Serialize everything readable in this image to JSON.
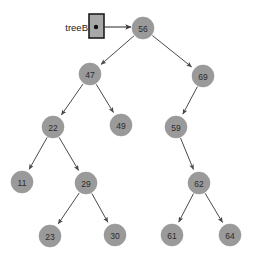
{
  "diagram": {
    "background_color": "#ffffff",
    "node_fill_color": "#9a9a9a",
    "node_text_color": "#2b2b2b",
    "edge_color": "#4a4a4a",
    "pointer_box": {
      "label": "treeB",
      "x": 89,
      "y": 14,
      "width": 15,
      "height": 24,
      "fill": "#a8a8a8",
      "border_color": "#1d1d1d",
      "dot_x": 96,
      "dot_y": 27,
      "dot_radius": 2.2,
      "label_x": 88,
      "label_y": 27
    },
    "pointer_arrow": {
      "x1": 104,
      "y1": 27,
      "x2": 131,
      "y2": 27
    },
    "node_radius": 11,
    "nodes": [
      {
        "id": "n56",
        "label": "56",
        "x": 143,
        "y": 28
      },
      {
        "id": "n47",
        "label": "47",
        "x": 90,
        "y": 74
      },
      {
        "id": "n69",
        "label": "69",
        "x": 203,
        "y": 76
      },
      {
        "id": "n22",
        "label": "22",
        "x": 53,
        "y": 127
      },
      {
        "id": "n49",
        "label": "49",
        "x": 121,
        "y": 125
      },
      {
        "id": "n59",
        "label": "59",
        "x": 176,
        "y": 127
      },
      {
        "id": "n11",
        "label": "11",
        "x": 22,
        "y": 182
      },
      {
        "id": "n29",
        "label": "29",
        "x": 86,
        "y": 183
      },
      {
        "id": "n62",
        "label": "62",
        "x": 199,
        "y": 183
      },
      {
        "id": "n23",
        "label": "23",
        "x": 50,
        "y": 236
      },
      {
        "id": "n30",
        "label": "30",
        "x": 115,
        "y": 235
      },
      {
        "id": "n61",
        "label": "61",
        "x": 172,
        "y": 235
      },
      {
        "id": "n64",
        "label": "64",
        "x": 230,
        "y": 235
      }
    ],
    "edges": [
      {
        "from": "n56",
        "to": "n47",
        "side": "left"
      },
      {
        "from": "n56",
        "to": "n69",
        "side": "right"
      },
      {
        "from": "n47",
        "to": "n22",
        "side": "left"
      },
      {
        "from": "n47",
        "to": "n49",
        "side": "right"
      },
      {
        "from": "n69",
        "to": "n59",
        "side": "left"
      },
      {
        "from": "n22",
        "to": "n11",
        "side": "left"
      },
      {
        "from": "n22",
        "to": "n29",
        "side": "right"
      },
      {
        "from": "n59",
        "to": "n62",
        "side": "right"
      },
      {
        "from": "n29",
        "to": "n23",
        "side": "left"
      },
      {
        "from": "n29",
        "to": "n30",
        "side": "right"
      },
      {
        "from": "n62",
        "to": "n61",
        "side": "left"
      },
      {
        "from": "n62",
        "to": "n64",
        "side": "right"
      }
    ]
  }
}
